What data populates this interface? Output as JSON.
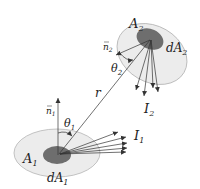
{
  "diagram": {
    "type": "radiative-view-factor",
    "labels": {
      "area1": "A",
      "area1_sub": "1",
      "darea1": "dA",
      "darea1_sub": "1",
      "area2": "A",
      "area2_sub": "2",
      "darea2": "dA",
      "darea2_sub": "2",
      "normal1": "n",
      "normal1_sub": "1",
      "normal2": "n",
      "normal2_sub": "2",
      "theta1": "θ",
      "theta1_sub": "1",
      "theta2": "θ",
      "theta2_sub": "2",
      "distance": "r",
      "intensity1": "I",
      "intensity1_sub": "1",
      "intensity2": "I",
      "intensity2_sub": "2"
    },
    "colors": {
      "surface_fill": "#ececec",
      "surface_stroke": "#b5b5b5",
      "patch_fill": "#6e6e6e",
      "line": "#333333"
    }
  }
}
